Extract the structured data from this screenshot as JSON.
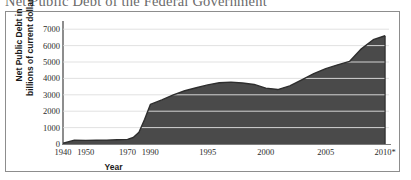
{
  "figure": {
    "title": "Net Public Debt of the Federal Government",
    "x_axis_title": "Year",
    "y_axis_title_line1": "Net Public Debt in",
    "y_axis_title_line2": "billions of current dollars"
  },
  "colors": {
    "area_fill": "#4a4a4a",
    "area_line": "#2e2e2e",
    "gridline": "#ffffff",
    "upper_gridline": "#d9d9d9",
    "axis": "#8d8d8d",
    "border": "#8d8d8d",
    "title_text": "#6a6a6a",
    "label_text": "#1a1a1a"
  },
  "chart_data": {
    "type": "area",
    "title": "Net Public Debt of the Federal Government",
    "xlabel": "Year",
    "ylabel": "Net Public Debt in billions of current dollars",
    "ylim": [
      0,
      7500
    ],
    "y_ticks": [
      0,
      1000,
      2000,
      3000,
      4000,
      5000,
      6000,
      7000
    ],
    "y_tick_labels": [
      "0",
      "1000",
      "2000",
      "3000",
      "4000",
      "5000",
      "6000",
      "7000"
    ],
    "x_tick_labels": [
      "1940",
      "1950",
      "1970",
      "1990",
      "1995",
      "2000",
      "2005",
      "2010*"
    ],
    "x_tick_values": [
      1940,
      1950,
      1970,
      1990,
      1995,
      2000,
      2005,
      2010
    ],
    "x_axis_note": "Axis spacing is non-linear: 1940-1990 compressed, 1990-2010 expanded",
    "grid": "horizontal",
    "legend": "none",
    "footnote_marker": "*",
    "series": [
      {
        "name": "Net Public Debt",
        "x": [
          1940,
          1945,
          1950,
          1955,
          1960,
          1965,
          1970,
          1975,
          1980,
          1985,
          1990,
          1991,
          1992,
          1993,
          1994,
          1995,
          1996,
          1997,
          1998,
          1999,
          2000,
          2001,
          2002,
          2003,
          2004,
          2005,
          2006,
          2007,
          2008,
          2009,
          2010
        ],
        "values": [
          43,
          235,
          219,
          227,
          237,
          261,
          283,
          395,
          712,
          1507,
          2412,
          2689,
          3000,
          3248,
          3433,
          3604,
          3734,
          3772,
          3721,
          3632,
          3410,
          3320,
          3540,
          3913,
          4296,
          4592,
          4829,
          5035,
          5803,
          6361,
          6600
        ]
      }
    ]
  }
}
